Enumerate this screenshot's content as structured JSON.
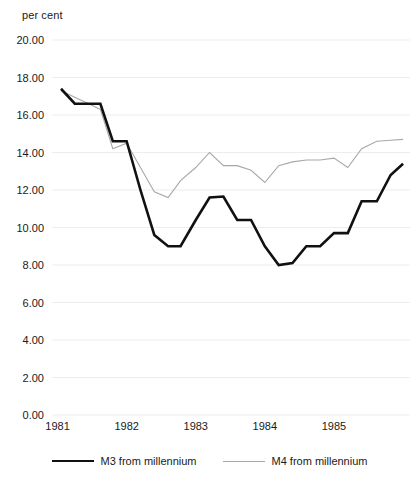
{
  "chart_data": {
    "type": "line",
    "title": "",
    "subtitle": "",
    "xlabel": "",
    "ylabel": "per cent",
    "unit_label": "per cent",
    "ylim": [
      0.0,
      20.0
    ],
    "ytick_step": 2.0,
    "ytick_labels": [
      "20.00",
      "18.00",
      "16.00",
      "14.00",
      "12.00",
      "10.00",
      "8.00",
      "6.00",
      "4.00",
      "2.00",
      "0.00"
    ],
    "ytick_values": [
      20.0,
      18.0,
      16.0,
      14.0,
      12.0,
      10.0,
      8.0,
      6.0,
      4.0,
      2.0,
      0.0
    ],
    "xtick_labels": [
      "1981",
      "1982",
      "1983",
      "1984",
      "1985"
    ],
    "xtick_values": [
      1981.0,
      1982.0,
      1983.0,
      1984.0,
      1985.0
    ],
    "xlim": [
      1980.92,
      1986.1
    ],
    "grid": true,
    "grid_axis": "y",
    "legend_position": "bottom",
    "colors": {
      "m3": "#111111",
      "m4": "#a8a8a8",
      "grid": "#ededed",
      "text": "#1a1a1a",
      "background": "#ffffff"
    },
    "series": [
      {
        "name": "M3 from millennium",
        "color": "#111111",
        "linewidth": 2.6,
        "x": [
          1981.05,
          1981.25,
          1981.45,
          1981.62,
          1981.8,
          1982.0,
          1982.2,
          1982.4,
          1982.6,
          1982.78,
          1983.0,
          1983.2,
          1983.4,
          1983.6,
          1983.8,
          1984.0,
          1984.2,
          1984.4,
          1984.6,
          1984.8,
          1985.0,
          1985.2,
          1985.4,
          1985.62,
          1985.82,
          1986.0
        ],
        "values": [
          17.4,
          16.6,
          16.6,
          16.6,
          14.6,
          14.6,
          12.0,
          9.6,
          9.0,
          9.0,
          10.4,
          11.6,
          11.65,
          10.4,
          10.4,
          9.0,
          8.0,
          8.1,
          9.0,
          9.0,
          9.7,
          9.7,
          11.4,
          11.4,
          12.8,
          13.4
        ]
      },
      {
        "name": "M4 from millennium",
        "color": "#a8a8a8",
        "linewidth": 1.1,
        "x": [
          1981.05,
          1981.25,
          1981.45,
          1981.62,
          1981.8,
          1982.0,
          1982.2,
          1982.4,
          1982.6,
          1982.78,
          1983.0,
          1983.2,
          1983.4,
          1983.6,
          1983.8,
          1984.0,
          1984.2,
          1984.4,
          1984.6,
          1984.8,
          1985.0,
          1985.2,
          1985.4,
          1985.62,
          1985.82,
          1986.0
        ],
        "values": [
          17.3,
          16.95,
          16.6,
          16.3,
          14.2,
          14.5,
          13.2,
          11.9,
          11.6,
          12.5,
          13.2,
          14.0,
          13.3,
          13.3,
          13.05,
          12.4,
          13.3,
          13.5,
          13.6,
          13.6,
          13.7,
          13.2,
          14.2,
          14.6,
          14.65,
          14.7
        ]
      }
    ]
  },
  "legend": {
    "entries": [
      {
        "label": "M3 from millennium",
        "style": "m3"
      },
      {
        "label": "M4 from millennium",
        "style": "m4"
      }
    ]
  }
}
